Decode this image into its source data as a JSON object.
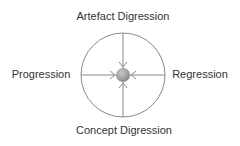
{
  "diagram": {
    "labels": {
      "top": "Artefact Digression",
      "left": "Progression",
      "right": "Regression",
      "bottom": "Concept Digression"
    },
    "colors": {
      "line": "#888888",
      "center_fill": "#a0a0a0",
      "text": "#333333"
    },
    "shapes": [
      "outer-circle",
      "horizontal-axis",
      "vertical-axis",
      "center-node",
      "inward-arrows"
    ]
  }
}
